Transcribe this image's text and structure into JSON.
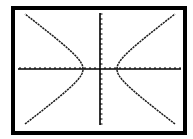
{
  "window": {
    "title": "Graphing calculator screen - hyperbola"
  },
  "colors": {
    "background": "#ffffff",
    "frame": "#000000",
    "axes": "#000000",
    "curve": "#1a1a1a"
  },
  "chart_data": {
    "type": "line",
    "title": "",
    "xlabel": "",
    "ylabel": "",
    "equation_estimate": "x^2/12 - y^2/7 = 1",
    "center": [
      0,
      0
    ],
    "a": 3.4,
    "b": 2.6,
    "vertices": [
      [
        -3.4,
        0
      ],
      [
        3.4,
        0
      ]
    ],
    "xlim": [
      -16.5,
      16.5
    ],
    "ylim": [
      -11.5,
      11.5
    ],
    "x_tick_step": 1,
    "y_tick_step": 1,
    "x_ticks_each_side": 16,
    "y_ticks_each_side": 11,
    "grid": false,
    "legend": null,
    "series": [
      {
        "name": "right branch",
        "points": [
          [
            3.4,
            0
          ],
          [
            4,
            1.37
          ],
          [
            5,
            1.94
          ],
          [
            6,
            2.89
          ],
          [
            8,
            4.6
          ],
          [
            10,
            6.3
          ],
          [
            12,
            8.0
          ],
          [
            15,
            10.4
          ]
        ]
      },
      {
        "name": "left branch",
        "points": [
          [
            -3.4,
            0
          ],
          [
            -4,
            1.37
          ],
          [
            -5,
            1.94
          ],
          [
            -6,
            2.89
          ],
          [
            -8,
            4.6
          ],
          [
            -10,
            6.3
          ],
          [
            -12,
            8.0
          ],
          [
            -15,
            10.4
          ]
        ]
      }
    ]
  },
  "layout": {
    "frame": {
      "x": 13,
      "y": 8,
      "w": 172,
      "h": 125,
      "stroke": 4
    },
    "origin_px": [
      100,
      69
    ],
    "unit_px_x": 5,
    "unit_px_y": 5,
    "x_axis_px": [
      18,
      181
    ],
    "y_axis_px": [
      13,
      125
    ],
    "a_px": 17,
    "b_px": 12.8,
    "curve_extent_px": 75
  }
}
